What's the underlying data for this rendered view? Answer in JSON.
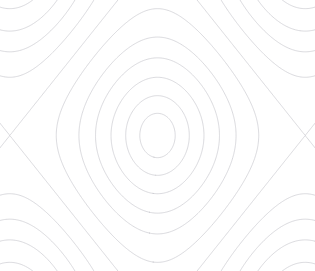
{
  "figure": {
    "title": "",
    "background_color": "#ffffff",
    "width": 315,
    "height": 271
  },
  "chart_data": {
    "type": "line",
    "subtype": "contour",
    "title": "",
    "subtitle": "",
    "xlabel": "",
    "ylabel": "",
    "xlim": [
      -3.35,
      3.35
    ],
    "ylim": [
      -2.3,
      2.3
    ],
    "grid": false,
    "legend": false,
    "axes_visible": false,
    "ticks_visible": false,
    "frame_visible": false,
    "field_expression": "z = cos(x) + cos(y)",
    "line_color": "#c9c9cf",
    "line_width": 0.7,
    "n_levels": 11,
    "levels": [
      -1.55,
      -1.2,
      -0.85,
      -0.45,
      0.0,
      0.45,
      0.9,
      1.25,
      1.55,
      1.78,
      1.93
    ],
    "centers": [
      {
        "name": "left-well",
        "x": -1.5708,
        "y": 0.0,
        "pixel_x": 86,
        "pixel_y": 135
      },
      {
        "name": "right-well",
        "x": 1.5708,
        "y": 0.0,
        "pixel_x": 235,
        "pixel_y": 135
      }
    ],
    "saddles": [
      {
        "name": "center-saddle",
        "x": 0.0,
        "y": 0.0,
        "pixel_x": 160,
        "pixel_y": 135
      }
    ],
    "extents": {
      "top_peak_y_px": 15,
      "bottom_trough_y_px": 255,
      "left_clip_x_px": 13,
      "right_clip_x_px": 301
    }
  },
  "render": {
    "grid_nx": 360,
    "grid_ny": 300
  }
}
